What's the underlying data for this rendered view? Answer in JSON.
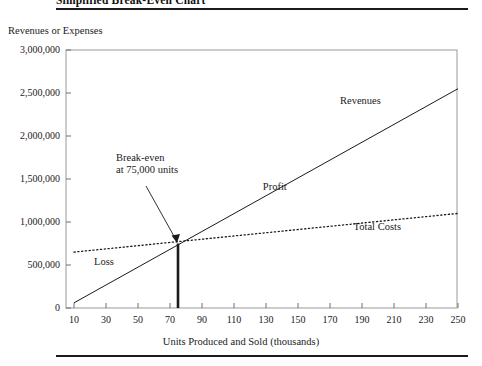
{
  "figure": {
    "title": "Simplified Break-Even Chart",
    "top_rule": true,
    "bottom_rule": true
  },
  "chart_data": {
    "type": "line",
    "title": "Simplified Break-Even Chart",
    "xlabel": "Units Produced and Sold (thousands)",
    "ylabel": "Revenues or Expenses",
    "xlim": [
      10,
      250
    ],
    "ylim": [
      0,
      3000000
    ],
    "grid": false,
    "legend": "inline-labels",
    "x_ticks": [
      10,
      30,
      50,
      70,
      90,
      110,
      130,
      150,
      170,
      190,
      210,
      230,
      250
    ],
    "x_tick_labels": [
      "10",
      "30",
      "50",
      "70",
      "90",
      "110",
      "130",
      "150",
      "170",
      "190",
      "210",
      "230",
      "250"
    ],
    "y_ticks": [
      0,
      500000,
      1000000,
      1500000,
      2000000,
      2500000,
      3000000
    ],
    "y_tick_labels": [
      "0",
      "500,000",
      "1,000,000",
      "1,500,000",
      "2,000,000",
      "2,500,000",
      "3,000,000"
    ],
    "series": [
      {
        "name": "Revenues",
        "style": "solid",
        "x": [
          10,
          250
        ],
        "values": [
          60000,
          2550000
        ],
        "label_x": 190,
        "label_y": 2400000
      },
      {
        "name": "Total Costs",
        "style": "dotted",
        "x": [
          10,
          250
        ],
        "values": [
          650000,
          1100000
        ],
        "label_x": 196,
        "label_y": 930000
      }
    ],
    "regions": [
      {
        "name": "Loss",
        "label_x": 30,
        "label_y": 520000
      },
      {
        "name": "Profit",
        "label_x": 138,
        "label_y": 1400000
      }
    ],
    "annotations": [
      {
        "name": "break-even",
        "text_line1": "Break-even",
        "text_line2": "at 75,000 units",
        "point_x": 75,
        "point_y": 750000,
        "marker": "vertical-line-from-axis"
      }
    ]
  }
}
